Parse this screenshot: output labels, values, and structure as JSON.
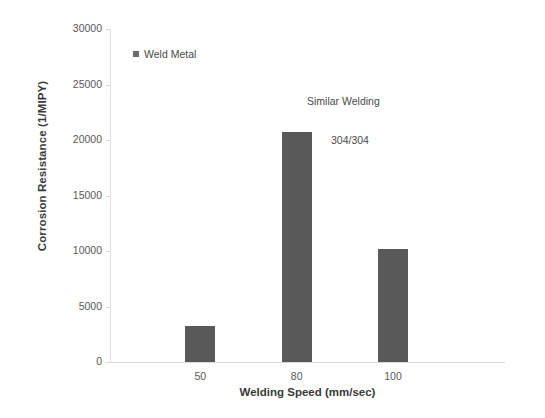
{
  "chart_data": {
    "type": "bar",
    "title": "",
    "categories": [
      "50",
      "80",
      "100"
    ],
    "values": [
      3250,
      20700,
      10150
    ],
    "series": [
      {
        "name": "Weld Metal",
        "values": [
          3250,
          20700,
          10150
        ]
      }
    ],
    "xlabel": "Welding Speed (mm/sec)",
    "ylabel": "Corrosion Resistance (1/MIPY)",
    "ylim": [
      0,
      30000
    ],
    "yticks": [
      "0",
      "5000",
      "10000",
      "15000",
      "20000",
      "25000",
      "30000"
    ],
    "ytick_values": [
      0,
      5000,
      10000,
      15000,
      20000,
      25000,
      30000
    ],
    "grid": false,
    "legend_position": "upper-center",
    "bar_color": "#595959",
    "axis_color": "#d8d8d8",
    "annotations": [
      {
        "text": "Similar Welding"
      },
      {
        "text": "304/304"
      }
    ]
  },
  "legend": {
    "label": "Weld Metal",
    "swatch_color": "#6b6b6b"
  }
}
